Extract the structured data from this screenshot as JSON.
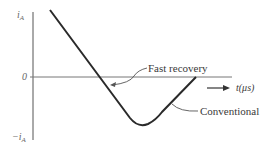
{
  "diagram": {
    "y_axis": {
      "top_label_main": "i",
      "top_label_sub": "A",
      "zero_label": "0",
      "bottom_label_main": "−i",
      "bottom_label_sub": "A"
    },
    "x_axis": {
      "label": "t(μs)"
    },
    "annotations": {
      "fast_recovery": "Fast recovery",
      "conventional": "Conventional"
    },
    "colors": {
      "axis": "#555555",
      "curve": "#2a2a2a",
      "text": "#3a3a3a"
    }
  }
}
